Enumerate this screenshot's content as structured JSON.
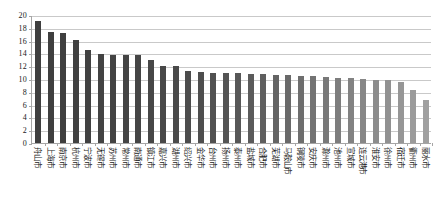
{
  "chart_data": {
    "type": "bar",
    "title": "",
    "xlabel": "",
    "ylabel": "",
    "ylim": [
      0,
      20
    ],
    "ytick_step": 2,
    "yticks": [
      20,
      18,
      16,
      14,
      12,
      10,
      8,
      6,
      4,
      2,
      0
    ],
    "grid": true,
    "legend": "none",
    "orientation": "vertical",
    "xtick_label_rotation": 90,
    "categories": [
      "舟山市",
      "上海市",
      "南京市",
      "杭州市",
      "宁波市",
      "无锡市",
      "苏州市",
      "常州市",
      "南通市",
      "镇江市",
      "嘉兴市",
      "湖州市",
      "绍兴市",
      "金华市",
      "台州市",
      "扬州市",
      "泰州市",
      "盐城市",
      "合肥市",
      "芜湖市",
      "马鞍山市",
      "铜陵市",
      "安庆市",
      "滁州市",
      "池州市",
      "宣城市",
      "连云港市",
      "淮安市",
      "徐州市",
      "宿迁市",
      "衢州市",
      "丽水市"
    ],
    "values": [
      19.0,
      17.4,
      17.2,
      16.1,
      14.6,
      13.9,
      13.8,
      13.8,
      13.7,
      12.9,
      12.1,
      12.0,
      11.2,
      11.1,
      11.0,
      10.9,
      10.9,
      10.8,
      10.8,
      10.7,
      10.6,
      10.5,
      10.4,
      10.3,
      10.2,
      10.1,
      10.0,
      9.9,
      9.8,
      9.6,
      8.3,
      6.7
    ],
    "bar_colors": [
      "#3f3f3f",
      "#3f3f3f",
      "#3f3f3f",
      "#414141",
      "#414141",
      "#434343",
      "#434343",
      "#444444",
      "#454545",
      "#474747",
      "#484848",
      "#4a4a4a",
      "#4c4c4c",
      "#4e4e4e",
      "#515151",
      "#545454",
      "#575757",
      "#5b5b5b",
      "#5f5f5f",
      "#646464",
      "#696969",
      "#6e6e6e",
      "#737373",
      "#787878",
      "#7d7d7d",
      "#828282",
      "#878787",
      "#8c8c8c",
      "#919191",
      "#969696",
      "#9b9b9b",
      "#a0a0a0"
    ],
    "axis_color": "#a6a6a6",
    "grid_color": "#c9c9c9",
    "background_color": "#ffffff"
  }
}
